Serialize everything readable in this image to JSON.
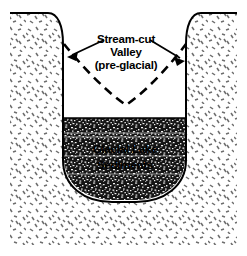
{
  "figure": {
    "background_color": "#ffffff",
    "line_color": "#000000",
    "width": 247,
    "height": 256
  },
  "labels": {
    "valley": {
      "name": "stream-cut-valley-label",
      "line1": "Stream-cut",
      "line2": "Valley",
      "line3": "(pre-glacial)"
    },
    "sediment": {
      "name": "glacial-lake-sediments-label",
      "line1": "Glacial Lake",
      "line2": "Sediments"
    }
  },
  "features": {
    "bedrock": {
      "name": "bedrock-till-mass",
      "texture": "random-dash-stipple",
      "fill_color": "#ffffff",
      "dash_color": "#6d6d6d"
    },
    "glacial_valley": {
      "name": "u-shaped-glacial-valley",
      "shape": "u-shaped",
      "fill_color": "#ffffff"
    },
    "preglacial_valley": {
      "name": "preglacial-stream-valley-dashed-line",
      "shape": "v-shaped",
      "line_style": "dashed"
    },
    "lake_sediments": {
      "name": "glacial-lake-sediment-fill",
      "texture": "dense-mottled-gravel",
      "fill_color": "#1a1a1a"
    },
    "leader_arrows": {
      "name": "label-leader-arrows",
      "count": 2,
      "style": "solid-line-with-arrowhead"
    }
  }
}
